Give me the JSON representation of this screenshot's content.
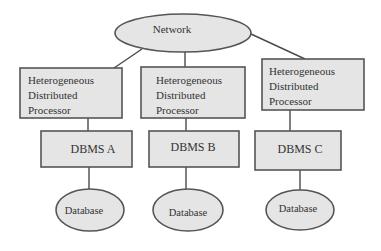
{
  "diagram": {
    "network": {
      "label": "Network"
    },
    "processors": [
      {
        "lines": [
          "Heterogeneous",
          "Distributed",
          "Processor"
        ]
      },
      {
        "lines": [
          "Heterogeneous",
          "Distributed",
          "Processor"
        ]
      },
      {
        "lines": [
          "Heterogeneous",
          "Distributed",
          "Processor"
        ]
      }
    ],
    "dbms": [
      {
        "label": "DBMS A"
      },
      {
        "label": "DBMS B"
      },
      {
        "label": "DBMS C"
      }
    ],
    "databases": [
      {
        "label": "Database"
      },
      {
        "label": "Database"
      },
      {
        "label": "Database"
      }
    ],
    "colors": {
      "fill": "#e5e5e5",
      "stroke": "#555555",
      "text": "#333333"
    }
  }
}
